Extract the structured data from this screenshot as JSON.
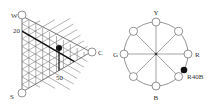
{
  "triangle": {
    "corners": {
      "top": "W",
      "bottom": "S",
      "right": "C"
    },
    "tick_labels": {
      "left": "20",
      "bottom": "50"
    },
    "colors": {
      "grid": "#555555",
      "highlight": "#111111",
      "dot": "#111111"
    }
  },
  "circle": {
    "labels": {
      "top": "Y",
      "right": "R",
      "bottom": "B",
      "left": "G"
    },
    "marker_label": "R40B",
    "colors": {
      "line": "#555555",
      "dot": "#111111"
    }
  }
}
